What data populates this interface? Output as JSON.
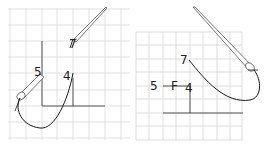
{
  "diagram": {
    "type": "embroidery-stitch-steps",
    "colors": {
      "grid": "#d4d4d4",
      "line": "#333333",
      "thread": "#1a1a1a",
      "needle": "#555555",
      "background": "#ffffff"
    },
    "panels": [
      {
        "id": "step-left",
        "labels": [
          {
            "text": "7",
            "x": 69,
            "y": 48
          },
          {
            "text": "5",
            "x": 34,
            "y": 76
          },
          {
            "text": "4",
            "x": 63,
            "y": 80
          }
        ]
      },
      {
        "id": "step-right",
        "labels": [
          {
            "text": "7",
            "x": 180,
            "y": 64
          },
          {
            "text": "5",
            "x": 150,
            "y": 90
          },
          {
            "text": "F",
            "x": 171,
            "y": 90
          },
          {
            "text": "4",
            "x": 185,
            "y": 92
          }
        ]
      }
    ]
  }
}
